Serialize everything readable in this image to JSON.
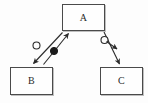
{
  "diagram": {
    "type": "node-link-diagram",
    "background_color": "#fdfdfd",
    "stroke_color": "#2a2a2a",
    "box_border_color": "#4a4a4a",
    "nodes": [
      {
        "id": "A",
        "label": "A",
        "position": "top-center",
        "x": 62,
        "y": 4,
        "width": 43,
        "height": 27
      },
      {
        "id": "B",
        "label": "B",
        "position": "bottom-left",
        "x": 10,
        "y": 67,
        "width": 43,
        "height": 28
      },
      {
        "id": "C",
        "label": "C",
        "position": "bottom-right",
        "x": 100,
        "y": 67,
        "width": 43,
        "height": 28
      }
    ],
    "edges": [
      {
        "id": "edge-a-b",
        "from": "A",
        "to": "B",
        "direction": "down-left",
        "arrowhead": "filled-solid",
        "marker": "open-circle",
        "marker_fill": "none"
      },
      {
        "id": "edge-b-a",
        "from": "B",
        "to": "A",
        "direction": "up-right",
        "arrowhead": "filled-solid",
        "marker": "filled-circle",
        "marker_fill": "#1a1a1a"
      },
      {
        "id": "edge-a-c",
        "from": "A",
        "to": "C",
        "direction": "down-right",
        "arrowhead": "filled-solid",
        "marker": "open-circle",
        "marker_fill": "none"
      },
      {
        "id": "edge-a-c-stub",
        "from": "A",
        "to": "C",
        "direction": "down-right",
        "arrowhead": "filled-solid",
        "marker": "none",
        "note": "short parallel arrow stub near open circle"
      }
    ]
  }
}
